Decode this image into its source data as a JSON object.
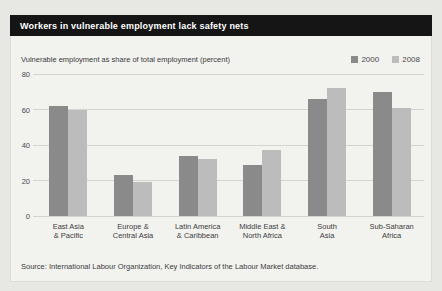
{
  "header": {
    "title": "Workers in vulnerable employment lack safety nets"
  },
  "chart_data": {
    "type": "bar",
    "title": "Workers in vulnerable employment lack safety nets",
    "subtitle": "Vulnerable employment as share of total employment (percent)",
    "xlabel": "",
    "ylabel": "",
    "ylim": [
      0,
      80
    ],
    "yticks": [
      0,
      20,
      40,
      60,
      80
    ],
    "grid": true,
    "legend_position": "top-right",
    "categories": [
      "East Asia & Pacific",
      "Europe & Central Asia",
      "Latin America & Caribbean",
      "Middle East & North Africa",
      "South Asia",
      "Sub-Saharan Africa"
    ],
    "category_label_lines": [
      [
        "East Asia",
        "& Pacific"
      ],
      [
        "Europe &",
        "Central Asia"
      ],
      [
        "Latin America",
        "& Caribbean"
      ],
      [
        "Middle East &",
        "North Africa"
      ],
      [
        "South",
        "Asia"
      ],
      [
        "Sub-Saharan",
        "Africa"
      ]
    ],
    "series": [
      {
        "name": "2000",
        "color": "#8a8a8a",
        "values": [
          62,
          23,
          34,
          29,
          66,
          70
        ]
      },
      {
        "name": "2008",
        "color": "#bcbcbc",
        "values": [
          60,
          19,
          32,
          37,
          72,
          61
        ]
      }
    ]
  },
  "source": {
    "text": "Source: International Labour Organization, Key Indicators of the Labour Market database."
  },
  "colors": {
    "page_bg": "#e7e8e3",
    "panel_bg": "#f2f2ef",
    "titlebar_bg": "#151515",
    "titlebar_text": "#ffffff",
    "gridline": "#d4d4ce",
    "bar_2000": "#8a8a8a",
    "bar_2008": "#bcbcbc"
  }
}
